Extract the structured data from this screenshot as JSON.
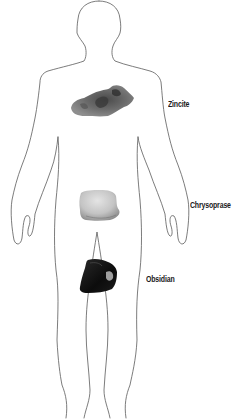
{
  "diagram": {
    "type": "body-map",
    "outline_color": "#555555",
    "background": "#ffffff"
  },
  "stones": [
    {
      "name": "Zincite",
      "position": "chest",
      "label_x": 168,
      "label_y": 99,
      "colors": [
        "#3a3a3a",
        "#6e6e6e",
        "#9a9a9a"
      ]
    },
    {
      "name": "Chrysoprase",
      "position": "lower abdomen",
      "label_x": 190,
      "label_y": 200,
      "colors": [
        "#b8b8b8",
        "#d6d6d6",
        "#8a8a8a"
      ]
    },
    {
      "name": "Obsidian",
      "position": "groin / base",
      "label_x": 146,
      "label_y": 274,
      "colors": [
        "#0f0f0f",
        "#2b2b2b",
        "#dcdcdc"
      ]
    }
  ]
}
